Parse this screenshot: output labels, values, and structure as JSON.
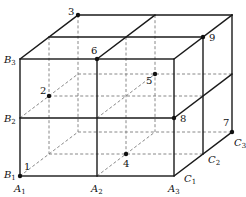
{
  "diagram": {
    "type": "3d-grid-box",
    "depth_step": [
      29,
      -22
    ],
    "front_x": [
      20,
      97,
      174
    ],
    "front_y": [
      59,
      118,
      176
    ],
    "points": [
      {
        "id": "1",
        "x": 20,
        "y": 176,
        "label_dx": 4,
        "label_dy": -6
      },
      {
        "id": "2",
        "x": 49,
        "y": 96,
        "label_dx": -9,
        "label_dy": -2
      },
      {
        "id": "3",
        "x": 78,
        "y": 15,
        "label_dx": -10,
        "label_dy": 0
      },
      {
        "id": "4",
        "x": 126,
        "y": 154,
        "label_dx": -3,
        "label_dy": 13
      },
      {
        "id": "5",
        "x": 155,
        "y": 74,
        "label_dx": -9,
        "label_dy": 10
      },
      {
        "id": "6",
        "x": 97,
        "y": 59,
        "label_dx": -6,
        "label_dy": -5
      },
      {
        "id": "7",
        "x": 232,
        "y": 132,
        "label_dx": -9,
        "label_dy": -6
      },
      {
        "id": "8",
        "x": 174,
        "y": 118,
        "label_dx": 6,
        "label_dy": 4
      },
      {
        "id": "9",
        "x": 203,
        "y": 37,
        "label_dx": 6,
        "label_dy": 4
      }
    ],
    "vertex_labels": [
      {
        "base": "B",
        "sub": "3",
        "x": 4,
        "y": 63
      },
      {
        "base": "B",
        "sub": "2",
        "x": 4,
        "y": 122
      },
      {
        "base": "B",
        "sub": "1",
        "x": 4,
        "y": 178
      },
      {
        "base": "A",
        "sub": "1",
        "x": 14,
        "y": 192
      },
      {
        "base": "A",
        "sub": "2",
        "x": 91,
        "y": 192
      },
      {
        "base": "A",
        "sub": "3",
        "x": 168,
        "y": 192
      },
      {
        "base": "C",
        "sub": "1",
        "x": 184,
        "y": 182
      },
      {
        "base": "C",
        "sub": "2",
        "x": 208,
        "y": 163
      },
      {
        "base": "C",
        "sub": "3",
        "x": 234,
        "y": 146
      }
    ]
  }
}
